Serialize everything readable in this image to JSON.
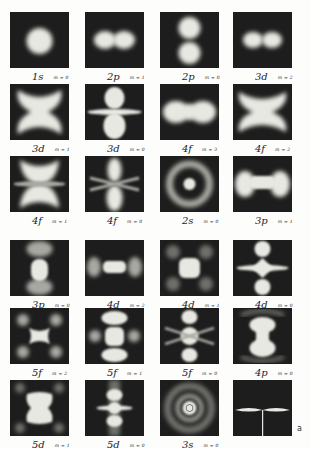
{
  "figure": {
    "panel_label": "a",
    "columns_x": [
      10,
      85,
      160,
      233
    ],
    "rows_y": [
      12,
      84,
      156,
      240,
      308,
      380
    ],
    "panels": [
      {
        "orbital": "1s",
        "m": "m = 0",
        "shape": "s1"
      },
      {
        "orbital": "2p",
        "m": "m = 1",
        "shape": "p1h"
      },
      {
        "orbital": "2p",
        "m": "m = 0",
        "shape": "p0v"
      },
      {
        "orbital": "3d",
        "m": "m = 2",
        "shape": "d2h"
      },
      {
        "orbital": "3d",
        "m": "m = 1",
        "shape": "d1x"
      },
      {
        "orbital": "3d",
        "m": "m = 0",
        "shape": "d0"
      },
      {
        "orbital": "4f",
        "m": "m = 3",
        "shape": "f3"
      },
      {
        "orbital": "4f",
        "m": "m = 2",
        "shape": "f2x"
      },
      {
        "orbital": "4f",
        "m": "m = 1",
        "shape": "f1"
      },
      {
        "orbital": "4f",
        "m": "m = 0",
        "shape": "f0"
      },
      {
        "orbital": "2s",
        "m": "m = 0",
        "shape": "s2"
      },
      {
        "orbital": "3p",
        "m": "m = 1",
        "shape": "p3h"
      },
      {
        "orbital": "3p",
        "m": "m = 0",
        "shape": "p3v"
      },
      {
        "orbital": "4d",
        "m": "m = 2",
        "shape": "d4h"
      },
      {
        "orbital": "4d",
        "m": "m = 1",
        "shape": "d4q"
      },
      {
        "orbital": "4d",
        "m": "m = 0",
        "shape": "d40"
      },
      {
        "orbital": "5f",
        "m": "m = 2",
        "shape": "f5q"
      },
      {
        "orbital": "5f",
        "m": "m = 1",
        "shape": "f51"
      },
      {
        "orbital": "5f",
        "m": "m = 0",
        "shape": "f50"
      },
      {
        "orbital": "4p",
        "m": "m = 0",
        "shape": "p4v"
      },
      {
        "orbital": "5d",
        "m": "m = 1",
        "shape": "d51"
      },
      {
        "orbital": "5d",
        "m": "m = 0",
        "shape": "d50"
      },
      {
        "orbital": "3s",
        "m": "m = 0",
        "shape": "s3"
      },
      {
        "orbital": "",
        "m": "",
        "shape": "cross"
      }
    ]
  }
}
